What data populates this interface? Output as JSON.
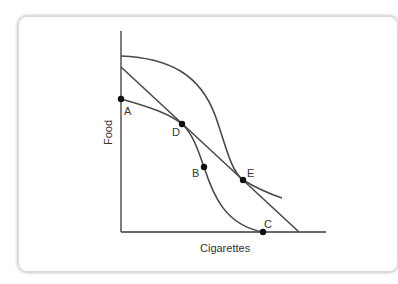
{
  "diagram": {
    "axes": {
      "x_label": "Cigarettes",
      "y_label": "Food"
    },
    "points": [
      {
        "id": "A",
        "label": "A"
      },
      {
        "id": "D",
        "label": "D"
      },
      {
        "id": "B",
        "label": "B"
      },
      {
        "id": "E",
        "label": "E"
      },
      {
        "id": "C",
        "label": "C"
      }
    ],
    "curves": [
      {
        "name": "outer-ppf-curve",
        "description": "bowed S-shaped frontier from food axis to cigarette axis through E"
      },
      {
        "name": "straight-ppf-line",
        "description": "linear frontier through D and E"
      },
      {
        "name": "inner-ppf-curve",
        "description": "curve A-D-B-C"
      },
      {
        "name": "e-extension-curve",
        "description": "short curve tangent through E"
      }
    ],
    "colors": {
      "line": "#4a4a4a",
      "axis": "#3a3a3a",
      "point": "#111111",
      "text": "#333333"
    }
  }
}
